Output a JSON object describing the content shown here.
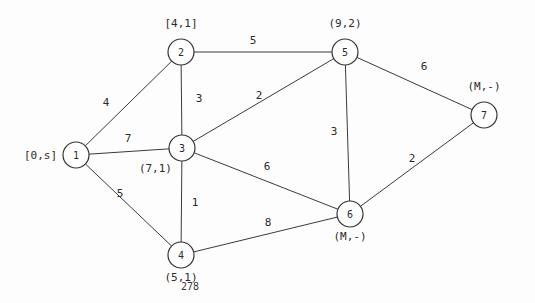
{
  "figure": {
    "page_number": "278",
    "background_color": "#fdfdfd",
    "ink_color": "#2b2b2b"
  },
  "chart_data": {
    "type": "diagram",
    "subtype": "weighted-undirected-graph",
    "title": "",
    "nodes": [
      {
        "id": "1",
        "x": 76,
        "y": 155,
        "r": 13,
        "label": "[0,s]",
        "label_x": 24,
        "label_y": 159,
        "label_anchor": "start"
      },
      {
        "id": "2",
        "x": 181,
        "y": 52,
        "r": 13,
        "label": "[4,1]",
        "label_x": 181,
        "label_y": 27,
        "label_anchor": "middle"
      },
      {
        "id": "3",
        "x": 182,
        "y": 148,
        "r": 13,
        "label": "(7,1)",
        "label_x": 172,
        "label_y": 172,
        "label_anchor": "end"
      },
      {
        "id": "4",
        "x": 181,
        "y": 255,
        "r": 13,
        "label": "(5,1)",
        "label_x": 181,
        "label_y": 281,
        "label_anchor": "middle"
      },
      {
        "id": "5",
        "x": 345,
        "y": 52,
        "r": 13,
        "label": "(9,2)",
        "label_x": 345,
        "label_y": 27,
        "label_anchor": "middle"
      },
      {
        "id": "6",
        "x": 350,
        "y": 214,
        "r": 13,
        "label": "(M,-)",
        "label_x": 350,
        "label_y": 240,
        "label_anchor": "middle"
      },
      {
        "id": "7",
        "x": 484,
        "y": 115,
        "r": 13,
        "label": "(M,-)",
        "label_x": 484,
        "label_y": 90,
        "label_anchor": "middle"
      }
    ],
    "edges": [
      {
        "from": "1",
        "to": "2",
        "weight": "4",
        "wx": 106,
        "wy": 106
      },
      {
        "from": "1",
        "to": "3",
        "weight": "7",
        "wx": 128,
        "wy": 142
      },
      {
        "from": "1",
        "to": "4",
        "weight": "5",
        "wx": 120,
        "wy": 197
      },
      {
        "from": "2",
        "to": "3",
        "weight": "3",
        "wx": 199,
        "wy": 102
      },
      {
        "from": "2",
        "to": "5",
        "weight": "5",
        "wx": 253,
        "wy": 44
      },
      {
        "from": "3",
        "to": "5",
        "weight": "2",
        "wx": 259,
        "wy": 99
      },
      {
        "from": "3",
        "to": "4",
        "weight": "1",
        "wx": 195,
        "wy": 206
      },
      {
        "from": "3",
        "to": "6",
        "weight": "6",
        "wx": 267,
        "wy": 170
      },
      {
        "from": "4",
        "to": "6",
        "weight": "8",
        "wx": 268,
        "wy": 226
      },
      {
        "from": "5",
        "to": "6",
        "weight": "3",
        "wx": 334,
        "wy": 135
      },
      {
        "from": "5",
        "to": "7",
        "weight": "6",
        "wx": 424,
        "wy": 70
      },
      {
        "from": "6",
        "to": "7",
        "weight": "2",
        "wx": 412,
        "wy": 162
      }
    ],
    "node_label_legend": "bracketed/parenthesized pairs are (distance, predecessor) labels; M denotes infinity and s denotes the source node",
    "xlabel": "",
    "ylabel": "",
    "grid": false,
    "legend": "none"
  }
}
